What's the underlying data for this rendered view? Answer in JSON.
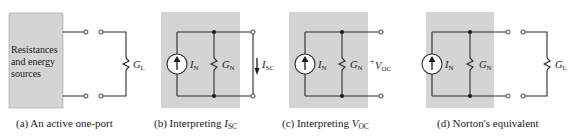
{
  "panels": [
    {
      "id": "a",
      "box_text": [
        "Resistances",
        "and energy",
        "sources"
      ],
      "load_label": "G",
      "load_sub": "L",
      "caption": "(a)  An active one-port"
    },
    {
      "id": "b",
      "source_label": "I",
      "source_sub": "N",
      "conductance_label": "G",
      "conductance_sub": "N",
      "current_label": "I",
      "current_sub": "SC",
      "caption_prefix": "(b)  Interpreting ",
      "caption_var": "I",
      "caption_sub": "SC"
    },
    {
      "id": "c",
      "source_label": "I",
      "source_sub": "N",
      "conductance_label": "G",
      "conductance_sub": "N",
      "voltage_plus": "+",
      "voltage_label": "V",
      "voltage_sub": "OC",
      "caption_prefix": "(c)  Interpreting ",
      "caption_var": "V",
      "caption_sub": "OC"
    },
    {
      "id": "d",
      "source_label": "I",
      "source_sub": "N",
      "conductance_label": "G",
      "conductance_sub": "N",
      "load_label": "G",
      "load_sub": "L",
      "caption": "(d)  Norton's equivalent"
    }
  ],
  "colors": {
    "box_fill": "#d4d4d4",
    "wire": "#2a2a2a"
  }
}
